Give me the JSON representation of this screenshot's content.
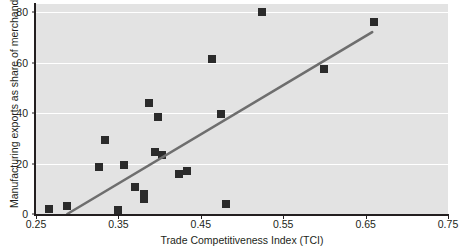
{
  "chart_data": {
    "type": "scatter",
    "title": "",
    "xlabel": "Trade Competitiveness Index (TCI)",
    "ylabel": "Manufacturing exports as share of merchandise export",
    "xlim": [
      0.25,
      0.75
    ],
    "ylim": [
      0,
      80
    ],
    "xticks": [
      "0.25",
      "0.35",
      "0.45",
      "0.55",
      "0.65",
      "0.75"
    ],
    "xtick_values": [
      0.25,
      0.35,
      0.45,
      0.55,
      0.65,
      0.75
    ],
    "yticks": [
      "0",
      "20",
      "40",
      "60",
      "80"
    ],
    "ytick_values": [
      0,
      20,
      40,
      60,
      80
    ],
    "grid": "horizontal-white-on-grey",
    "panel_color": "#e3e3e3",
    "marker_color": "#2b2b2b",
    "marker_shape": "square",
    "trendline": {
      "color": "#6e6e6e",
      "x_start": 0.288,
      "y_start": 0.0,
      "x_end": 0.658,
      "y_end": 72.0
    },
    "points": [
      {
        "x": 0.266,
        "y": 2.0
      },
      {
        "x": 0.288,
        "y": 3.0
      },
      {
        "x": 0.326,
        "y": 18.5
      },
      {
        "x": 0.334,
        "y": 29.5
      },
      {
        "x": 0.35,
        "y": 1.5
      },
      {
        "x": 0.357,
        "y": 19.5
      },
      {
        "x": 0.37,
        "y": 10.5
      },
      {
        "x": 0.381,
        "y": 8.0
      },
      {
        "x": 0.381,
        "y": 6.0
      },
      {
        "x": 0.387,
        "y": 44.0
      },
      {
        "x": 0.394,
        "y": 24.5
      },
      {
        "x": 0.398,
        "y": 38.5
      },
      {
        "x": 0.403,
        "y": 23.5
      },
      {
        "x": 0.424,
        "y": 16.0
      },
      {
        "x": 0.433,
        "y": 17.0
      },
      {
        "x": 0.463,
        "y": 61.5
      },
      {
        "x": 0.474,
        "y": 39.5
      },
      {
        "x": 0.48,
        "y": 4.0
      },
      {
        "x": 0.524,
        "y": 80.0
      },
      {
        "x": 0.599,
        "y": 57.5
      },
      {
        "x": 0.66,
        "y": 76.0
      }
    ]
  }
}
